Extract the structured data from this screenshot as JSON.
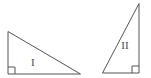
{
  "figure": {
    "canvas": {
      "width": 151,
      "height": 78
    },
    "background_color": "#ffffff",
    "stroke_color": "#555555",
    "label_color": "#4a4a4a",
    "stroke_width": 1,
    "shapes": [
      {
        "id": "triangle-1",
        "label": "I",
        "kind": "right-triangle",
        "label_x": 33,
        "label_y": 62,
        "right_angle_corner": "bottom-left",
        "right_angle_mark": {
          "x": 8,
          "y": 74,
          "size": 7
        },
        "points": "8,32 8,74 80,74",
        "vertices": [
          {
            "name": "apex-top-left",
            "x": 8,
            "y": 32
          },
          {
            "name": "right-angle-bottom-left",
            "x": 8,
            "y": 74
          },
          {
            "name": "bottom-right",
            "x": 80,
            "y": 74
          }
        ]
      },
      {
        "id": "triangle-2",
        "label": "II",
        "kind": "right-triangle",
        "label_x": 125,
        "label_y": 45,
        "right_angle_corner": "bottom-right",
        "right_angle_mark": {
          "x": 139,
          "y": 73,
          "size": 7
        },
        "points": "139,4 139,73 103,73",
        "vertices": [
          {
            "name": "apex-top-right",
            "x": 139,
            "y": 4
          },
          {
            "name": "right-angle-bottom-right",
            "x": 139,
            "y": 73
          },
          {
            "name": "bottom-left",
            "x": 103,
            "y": 73
          }
        ]
      }
    ]
  }
}
